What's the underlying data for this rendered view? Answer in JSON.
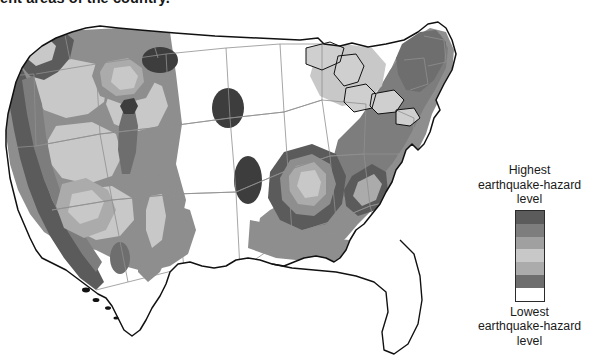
{
  "caption": {
    "text": "ent areas of the country."
  },
  "legend": {
    "top_label_lines": [
      "Highest",
      "earthquake-hazard",
      "level"
    ],
    "bottom_label_lines": [
      "Lowest",
      "earthquake-hazard",
      "level"
    ],
    "top_label": "Highest earthquake-hazard level",
    "bottom_label": "Lowest earthquake-hazard level",
    "bands": [
      {
        "name": "hazard-band-7-highest",
        "color": "#5b5b5b"
      },
      {
        "name": "hazard-band-6",
        "color": "#7d7d7d"
      },
      {
        "name": "hazard-band-5",
        "color": "#a0a0a0"
      },
      {
        "name": "hazard-band-4",
        "color": "#c8c8c8"
      },
      {
        "name": "hazard-band-3",
        "color": "#ababab"
      },
      {
        "name": "hazard-band-2",
        "color": "#6e6e6e"
      },
      {
        "name": "hazard-band-1-lowest",
        "color": "#ffffff"
      }
    ]
  },
  "map": {
    "title": "United States earthquake hazard map",
    "background": "#ffffff",
    "outline_color": "#111111",
    "state_border_color": "#8f8f8f",
    "lake_color": "#cfcfcf",
    "colors": {
      "highest": "#5b5b5b",
      "high": "#6e6e6e",
      "medium_high": "#7d7d7d",
      "medium": "#8e8e8e",
      "medium_low": "#ababab",
      "low": "#c8c8c8",
      "lowest": "#ffffff"
    },
    "regions": [
      {
        "name": "pacific-coast-california",
        "level": "highest"
      },
      {
        "name": "cascadia-pacific-northwest",
        "level": "highest"
      },
      {
        "name": "basin-and-range-nevada",
        "level": "medium"
      },
      {
        "name": "intermountain-west",
        "level": "medium"
      },
      {
        "name": "yellowstone-hot-spot",
        "level": "medium_high"
      },
      {
        "name": "wasatch-front-utah",
        "level": "medium_high"
      },
      {
        "name": "rio-grande-rift",
        "level": "medium"
      },
      {
        "name": "great-plains",
        "level": "lowest"
      },
      {
        "name": "new-madrid-seismic-zone",
        "level": "highest"
      },
      {
        "name": "eastern-tennessee-seismic-zone",
        "level": "medium_high"
      },
      {
        "name": "charleston-south-carolina",
        "level": "medium_high"
      },
      {
        "name": "appalachian-northeast",
        "level": "medium"
      },
      {
        "name": "new-england",
        "level": "medium"
      },
      {
        "name": "florida-gulf-coast",
        "level": "lowest"
      },
      {
        "name": "great-lakes-water",
        "level": "lowest"
      }
    ]
  }
}
